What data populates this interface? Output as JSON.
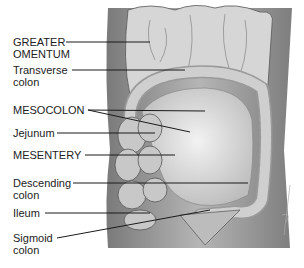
{
  "figure": {
    "colors": {
      "background": "#ffffff",
      "body_wall": "#8a8a8a",
      "organ": "#d9d9d9",
      "line": "#1a1a1a",
      "text": "#222222"
    },
    "labels": [
      {
        "id": "greater-omentum",
        "lines": [
          "GREATER",
          "OMENTUM"
        ],
        "y": 36,
        "pointer": [
          [
            66,
            42
          ],
          [
            150,
            42
          ]
        ]
      },
      {
        "id": "transverse-colon",
        "lines": [
          "Transverse",
          "colon"
        ],
        "y": 64,
        "pointer": [
          [
            72,
            70
          ],
          [
            185,
            70
          ]
        ]
      },
      {
        "id": "mesocolon",
        "lines": [
          "MESOCOLON"
        ],
        "y": 104,
        "pointer": [
          [
            88,
            110
          ],
          [
            205,
            111
          ]
        ],
        "pointer2": [
          [
            88,
            110
          ],
          [
            190,
            132
          ]
        ]
      },
      {
        "id": "jejunum",
        "lines": [
          "Jejunum"
        ],
        "y": 127,
        "pointer": [
          [
            57,
            133
          ],
          [
            155,
            133
          ]
        ]
      },
      {
        "id": "mesentery",
        "lines": [
          "MESENTERY"
        ],
        "y": 149,
        "pointer": [
          [
            85,
            155
          ],
          [
            175,
            155
          ]
        ]
      },
      {
        "id": "descending-colon",
        "lines": [
          "Descending",
          "colon"
        ],
        "y": 177,
        "pointer": [
          [
            73,
            183
          ],
          [
            248,
            183
          ]
        ]
      },
      {
        "id": "ileum",
        "lines": [
          "Ileum"
        ],
        "y": 207,
        "pointer": [
          [
            45,
            213
          ],
          [
            150,
            213
          ]
        ]
      },
      {
        "id": "sigmoid-colon",
        "lines": [
          "Sigmoid",
          "colon"
        ],
        "y": 232,
        "pointer": [
          [
            57,
            238
          ],
          [
            210,
            210
          ]
        ]
      }
    ]
  }
}
